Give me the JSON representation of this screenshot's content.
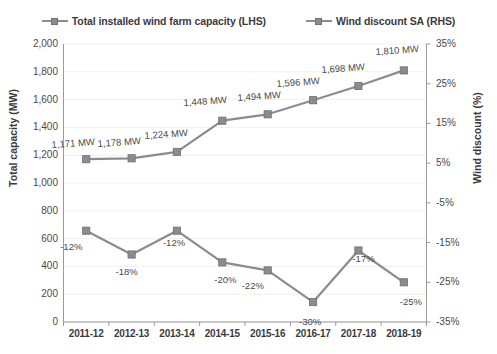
{
  "legend": {
    "items": [
      {
        "label": "Total installed wind farm capacity (LHS)",
        "marker": "square-line-marker"
      },
      {
        "label": "Wind discount SA (RHS)",
        "marker": "square-line-marker"
      }
    ]
  },
  "axes": {
    "left_title": "Total capacity (MW)",
    "right_title": "Wind discount (%)",
    "left_ticks": [
      "2,000",
      "1,800",
      "1,600",
      "1,400",
      "1,200",
      "1,000",
      "800",
      "600",
      "400",
      "200",
      "0"
    ],
    "right_ticks": [
      "35%",
      "25%",
      "15%",
      "5%",
      "-5%",
      "-15%",
      "-25%",
      "-35%"
    ],
    "x_ticks": [
      "2011-12",
      "2012-13",
      "2013-14",
      "2014-15",
      "2015-16",
      "2016-17",
      "2017-18",
      "2018-19"
    ]
  },
  "colors": {
    "series": "#8c8c8c",
    "marker_edge": "#6f6f6f",
    "axis": "#9a9a9a",
    "grid": "#f0f0f0",
    "text": "#3b3b3b"
  },
  "capacity_labels": [
    "1,171 MW",
    "1,178 MW",
    "1,224 MW",
    "1,448 MW",
    "1,494 MW",
    "1,596 MW",
    "1,698 MW",
    "1,810 MW"
  ],
  "discount_labels": [
    "-12%",
    "-18%",
    "-12%",
    "-20%",
    "-22%",
    "-30%",
    "-17%",
    "-25%"
  ],
  "chart_data": {
    "type": "line",
    "title": "",
    "xlabel": "",
    "categories": [
      "2011-12",
      "2012-13",
      "2013-14",
      "2014-15",
      "2015-16",
      "2016-17",
      "2017-18",
      "2018-19"
    ],
    "series": [
      {
        "name": "Total installed wind farm capacity (LHS)",
        "axis": "left",
        "unit": "MW",
        "values": [
          1171,
          1178,
          1224,
          1448,
          1494,
          1596,
          1698,
          1810
        ],
        "labels": [
          "1,171 MW",
          "1,178 MW",
          "1,224 MW",
          "1,448 MW",
          "1,494 MW",
          "1,596 MW",
          "1,698 MW",
          "1,810 MW"
        ]
      },
      {
        "name": "Wind discount SA (RHS)",
        "axis": "right",
        "unit": "%",
        "values": [
          -12,
          -18,
          -12,
          -20,
          -22,
          -30,
          -17,
          -25
        ],
        "labels": [
          "-12%",
          "-18%",
          "-12%",
          "-20%",
          "-22%",
          "-30%",
          "-17%",
          "-25%"
        ]
      }
    ],
    "ylabel": "Total capacity (MW)",
    "ylim": [
      0,
      2000
    ],
    "y2label": "Wind discount (%)",
    "y2lim": [
      -35,
      35
    ],
    "grid": true,
    "legend_position": "top"
  }
}
